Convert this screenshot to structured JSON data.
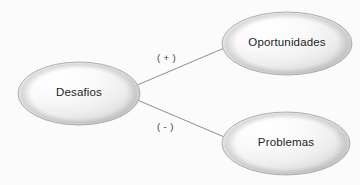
{
  "diagram": {
    "type": "concept-map",
    "background_color": "#fcfbfb",
    "node_outline_color": "#a9a9a9",
    "edge_color": "#8f8f8f",
    "text_color": "#232323",
    "nodes": [
      {
        "id": "desafios",
        "label": "Desafios",
        "shape": "ellipse",
        "cx": 79,
        "cy": 93.5,
        "rx": 61,
        "ry": 31.5
      },
      {
        "id": "oportunidades",
        "label": "Oportunidades",
        "shape": "ellipse",
        "cx": 287,
        "cy": 43.5,
        "rx": 65,
        "ry": 31.5
      },
      {
        "id": "problemas",
        "label": "Problemas",
        "shape": "ellipse",
        "cx": 286,
        "cy": 143.5,
        "rx": 64,
        "ry": 31.5
      }
    ],
    "edges": [
      {
        "id": "edge-desafios-oportunidades",
        "from": "desafios",
        "to": "oportunidades",
        "label": "( + )",
        "sign": "positive",
        "x1": 135,
        "y1": 86,
        "x2": 229,
        "y2": 46
      },
      {
        "id": "edge-desafios-problemas",
        "from": "desafios",
        "to": "problemas",
        "label": "( - )",
        "sign": "negative",
        "x1": 135,
        "y1": 99,
        "x2": 229,
        "y2": 139
      }
    ]
  }
}
